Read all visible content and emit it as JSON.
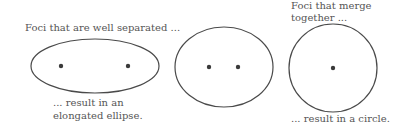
{
  "colors": {
    "stroke": "#4a4a4a",
    "dot": "#3a3a3a",
    "text": "#555555",
    "background": "#ffffff"
  },
  "panels": [
    {
      "id": "well-separated",
      "caption_top": [
        "Foci that are well separated ..."
      ],
      "caption_bottom": [
        "... result in an",
        "elongated ellipse."
      ],
      "shape": {
        "type": "ellipse",
        "cx": 95,
        "cy": 66,
        "rx": 64,
        "ry": 27
      },
      "foci": [
        {
          "x": 61,
          "y": 66
        },
        {
          "x": 128,
          "y": 66
        }
      ]
    },
    {
      "id": "closer-foci",
      "caption_top": [],
      "caption_bottom": [],
      "shape": {
        "type": "ellipse",
        "cx": 224,
        "cy": 67,
        "rx": 49,
        "ry": 40
      },
      "foci": [
        {
          "x": 209,
          "y": 67
        },
        {
          "x": 238,
          "y": 67
        }
      ]
    },
    {
      "id": "merged-foci",
      "caption_top": [
        "Foci that merge",
        "together ..."
      ],
      "caption_bottom": [
        "... result in a circle."
      ],
      "shape": {
        "type": "circle",
        "cx": 333,
        "cy": 68,
        "r": 44
      },
      "foci": [
        {
          "x": 333,
          "y": 68
        }
      ]
    }
  ]
}
